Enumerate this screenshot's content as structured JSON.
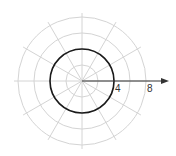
{
  "diagram": {
    "type": "polar-graph",
    "center": [
      82,
      81
    ],
    "pixels_per_unit": 8,
    "grid_radii": [
      2,
      4,
      6,
      8
    ],
    "ray_angles_deg": [
      0,
      30,
      60,
      90,
      120,
      150,
      180,
      210,
      240,
      270,
      300,
      330
    ],
    "curve": {
      "kind": "circle",
      "radius": 4,
      "color": "#1a1a1a"
    },
    "axis": {
      "from": [
        82,
        81
      ],
      "to": [
        168,
        81
      ]
    },
    "labels": [
      {
        "text": "4",
        "value": 4
      },
      {
        "text": "8",
        "value": 8
      }
    ],
    "colors": {
      "grid": "#d4d4d4",
      "curve": "#1a1a1a",
      "axis": "#333333"
    }
  }
}
